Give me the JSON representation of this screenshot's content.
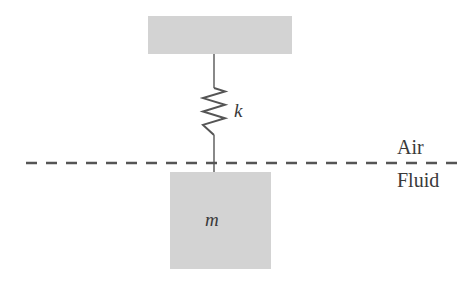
{
  "figure": {
    "type": "physics-diagram",
    "background_color": "#ffffff"
  },
  "elements": {
    "ceiling_block": {
      "name": "ceiling-support",
      "fill_color": "#d3d3d3",
      "x": 148,
      "y": 16,
      "width": 144,
      "height": 38
    },
    "mass_block": {
      "name": "mass-block",
      "label": "m",
      "fill_color": "#d3d3d3",
      "x": 170,
      "y": 172,
      "width": 101,
      "height": 97
    },
    "spring": {
      "name": "spring",
      "label": "k",
      "stroke_color": "#555555",
      "coils": 6,
      "top_y": 88,
      "bottom_y": 135,
      "center_x": 214,
      "amplitude": 11
    },
    "upper_rod": {
      "name": "upper-connecting-rod",
      "stroke_color": "#6b6b6b",
      "x": 214,
      "from_y": 54,
      "to_y": 88
    },
    "lower_rod": {
      "name": "lower-connecting-rod",
      "stroke_color": "#6b6b6b",
      "x": 214,
      "from_y": 135,
      "to_y": 175
    },
    "interface_line": {
      "name": "air-fluid-interface",
      "style": "dashed",
      "stroke_color": "#555555",
      "y": 163,
      "from_x": 26,
      "to_x": 458
    }
  },
  "labels": {
    "spring_constant": "k",
    "mass": "m",
    "upper_medium": "Air",
    "lower_medium": "Fluid"
  }
}
